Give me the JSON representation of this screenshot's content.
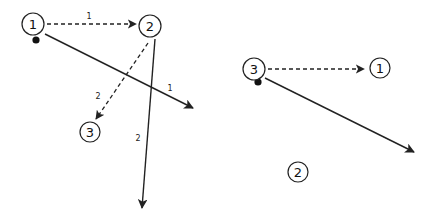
{
  "diagram": {
    "left": {
      "nodes": [
        {
          "id": "1",
          "label": "1",
          "cx": 33,
          "cy": 24,
          "r": 11,
          "marked": true,
          "dot": {
            "cx": 36,
            "cy": 40
          }
        },
        {
          "id": "2",
          "label": "2",
          "cx": 150,
          "cy": 26,
          "r": 11,
          "marked": false
        },
        {
          "id": "3",
          "label": "3",
          "cx": 90,
          "cy": 132,
          "r": 10,
          "marked": false
        }
      ],
      "edges": [
        {
          "from": "1",
          "to": "2",
          "style": "dashed",
          "label": "1",
          "x1": 47,
          "y1": 24,
          "x2": 136,
          "y2": 24,
          "lx": 89,
          "ly": 16
        },
        {
          "from": "2",
          "to": "3",
          "style": "dashed",
          "label": "2",
          "x1": 148,
          "y1": 43,
          "x2": 96,
          "y2": 119,
          "lx": 98,
          "ly": 96
        },
        {
          "from": "1",
          "to": "out",
          "style": "solid",
          "label": "1",
          "x1": 45,
          "y1": 34,
          "x2": 193,
          "y2": 108,
          "lx": 170,
          "ly": 88
        },
        {
          "from": "2",
          "to": "out",
          "style": "solid",
          "label": "2",
          "x1": 155,
          "y1": 39,
          "x2": 142,
          "y2": 208,
          "lx": 138,
          "ly": 138
        }
      ]
    },
    "right": {
      "nodes": [
        {
          "id": "3",
          "label": "3",
          "cx": 254,
          "cy": 69,
          "r": 11,
          "marked": true,
          "dot": {
            "cx": 258,
            "cy": 82
          }
        },
        {
          "id": "1",
          "label": "1",
          "cx": 380,
          "cy": 68,
          "r": 10,
          "marked": false
        },
        {
          "id": "2",
          "label": "2",
          "cx": 298,
          "cy": 172,
          "r": 10,
          "marked": false
        }
      ],
      "edges": [
        {
          "from": "3",
          "to": "1",
          "style": "dashed",
          "label": "",
          "x1": 268,
          "y1": 69,
          "x2": 364,
          "y2": 69
        },
        {
          "from": "3",
          "to": "out",
          "style": "solid",
          "label": "",
          "x1": 265,
          "y1": 78,
          "x2": 414,
          "y2": 152
        }
      ]
    }
  }
}
